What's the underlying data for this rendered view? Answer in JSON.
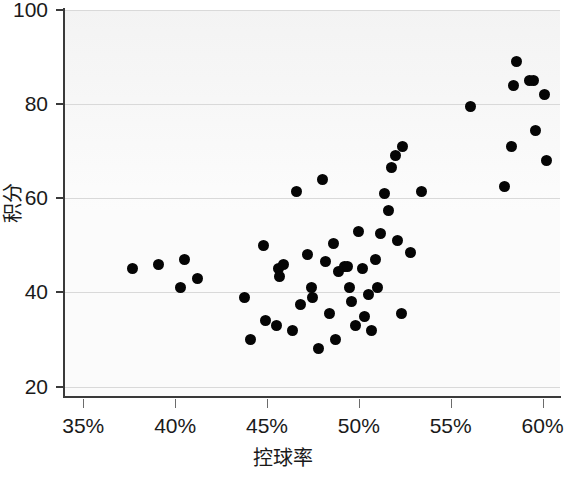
{
  "chart_data": {
    "type": "scatter",
    "title": "",
    "xlabel": "控球率",
    "ylabel": "积分",
    "xlim": [
      33.95,
      60.95
    ],
    "ylim": [
      18.0,
      100.0
    ],
    "xtick_labels": [
      "35%",
      "40%",
      "45%",
      "50%",
      "55%",
      "60%"
    ],
    "xticks": [
      35,
      40,
      45,
      50,
      55,
      60
    ],
    "ytick_labels": [
      "20",
      "40",
      "60",
      "80",
      "100"
    ],
    "yticks": [
      20,
      40,
      60,
      80,
      100
    ],
    "grid": "horizontal",
    "legend": "none",
    "marker": {
      "shape": "circle",
      "color": "#050505",
      "size_px": 11
    },
    "x_unit": "percent",
    "points": [
      [
        37.7,
        45.0
      ],
      [
        39.1,
        46.0
      ],
      [
        40.5,
        47.0
      ],
      [
        40.3,
        41.0
      ],
      [
        41.2,
        43.0
      ],
      [
        43.8,
        39.0
      ],
      [
        44.1,
        30.0
      ],
      [
        44.8,
        50.0
      ],
      [
        44.9,
        34.0
      ],
      [
        45.5,
        33.0
      ],
      [
        45.6,
        45.0
      ],
      [
        45.7,
        43.5
      ],
      [
        45.9,
        46.0
      ],
      [
        46.4,
        32.0
      ],
      [
        46.6,
        61.5
      ],
      [
        46.8,
        37.5
      ],
      [
        47.2,
        48.0
      ],
      [
        47.4,
        41.0
      ],
      [
        47.5,
        39.0
      ],
      [
        47.8,
        28.0
      ],
      [
        48.0,
        64.0
      ],
      [
        48.2,
        46.5
      ],
      [
        48.4,
        35.5
      ],
      [
        48.6,
        50.5
      ],
      [
        48.7,
        30.0
      ],
      [
        48.9,
        44.5
      ],
      [
        49.2,
        45.5
      ],
      [
        49.4,
        45.5
      ],
      [
        49.5,
        41.0
      ],
      [
        49.6,
        38.0
      ],
      [
        49.8,
        33.0
      ],
      [
        50.0,
        53.0
      ],
      [
        50.2,
        45.0
      ],
      [
        50.3,
        35.0
      ],
      [
        50.5,
        39.5
      ],
      [
        50.7,
        32.0
      ],
      [
        50.9,
        47.0
      ],
      [
        51.0,
        41.0
      ],
      [
        51.2,
        52.5
      ],
      [
        51.4,
        61.0
      ],
      [
        51.6,
        57.5
      ],
      [
        51.8,
        66.5
      ],
      [
        52.0,
        69.0
      ],
      [
        52.1,
        51.0
      ],
      [
        52.3,
        35.5
      ],
      [
        52.4,
        71.0
      ],
      [
        52.8,
        48.5
      ],
      [
        53.4,
        61.5
      ],
      [
        56.1,
        79.5
      ],
      [
        57.9,
        62.5
      ],
      [
        58.3,
        71.0
      ],
      [
        58.4,
        84.0
      ],
      [
        58.6,
        89.0
      ],
      [
        59.3,
        85.0
      ],
      [
        59.5,
        85.0
      ],
      [
        59.6,
        74.5
      ],
      [
        60.1,
        82.0
      ],
      [
        60.2,
        68.0
      ]
    ]
  },
  "axes": {
    "y_label": "积分",
    "x_label": "控球率",
    "y_ticks": [
      "100",
      "80",
      "60",
      "40",
      "20"
    ],
    "x_ticks": [
      "35%",
      "40%",
      "45%",
      "50%",
      "55%",
      "60%"
    ]
  }
}
